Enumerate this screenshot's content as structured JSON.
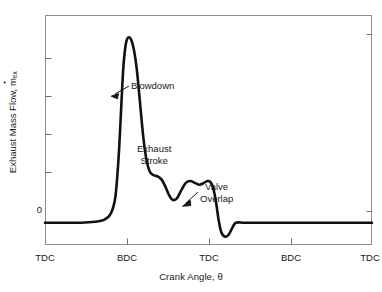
{
  "chart_data": {
    "type": "line",
    "title": "",
    "xlabel": "Crank Angle, θ",
    "ylabel_text": "Exhaust Mass Flow, ",
    "ylabel_symbol": "m",
    "ylabel_symbol_sub": "ex",
    "ylabel_full": "Exhaust Mass Flow, ṁex",
    "xtick_labels": [
      "TDC",
      "BDC",
      "TDC",
      "BDC",
      "TDC"
    ],
    "xtick_positions_px": [
      45,
      127,
      209,
      291,
      372
    ],
    "ytick_labels": [
      "0"
    ],
    "ytick_zero_px": 211,
    "ytick_minor_px": [
      58,
      96,
      134,
      172
    ],
    "grid": false,
    "legend": "none",
    "xlim": [
      0,
      720
    ],
    "ylim": [
      -0.12,
      1.12
    ],
    "series": [
      {
        "name": "Exhaust Mass Flow",
        "color": "#111111",
        "x": [
          0,
          40,
          80,
          110,
          130,
          145,
          155,
          162,
          168,
          172,
          176,
          180,
          185,
          190,
          196,
          202,
          208,
          214,
          220,
          226,
          232,
          240,
          248,
          256,
          264,
          272,
          280,
          290,
          300,
          310,
          320,
          330,
          340,
          350,
          358,
          364,
          370,
          376,
          382,
          388,
          396,
          404,
          412,
          420,
          440,
          480,
          520,
          560,
          600,
          640,
          680,
          720
        ],
        "y": [
          0.0,
          0.0,
          0.0,
          0.005,
          0.015,
          0.05,
          0.14,
          0.35,
          0.63,
          0.82,
          0.93,
          0.985,
          1.0,
          0.985,
          0.93,
          0.83,
          0.68,
          0.52,
          0.39,
          0.31,
          0.27,
          0.255,
          0.25,
          0.235,
          0.2,
          0.155,
          0.125,
          0.13,
          0.175,
          0.215,
          0.225,
          0.215,
          0.205,
          0.215,
          0.225,
          0.22,
          0.19,
          0.12,
          0.02,
          -0.05,
          -0.075,
          -0.065,
          -0.03,
          0.0,
          0.0,
          0.0,
          0.0,
          0.0,
          0.0,
          0.0,
          0.0,
          0.0
        ]
      }
    ],
    "annotations": [
      {
        "id": "blowdown",
        "text": "Blowdown",
        "lines": [
          "Blowdown"
        ],
        "label_px": [
          131,
          80
        ],
        "arrow_from_px": [
          128,
          87
        ],
        "arrow_to_px": [
          113,
          95
        ]
      },
      {
        "id": "exhaust-stroke",
        "text": "Exhaust Stroke",
        "lines": [
          "Exhaust",
          "Stroke"
        ],
        "label_px": [
          137,
          143
        ],
        "arrow_from_px": null,
        "arrow_to_px": null
      },
      {
        "id": "valve-overlap",
        "text": "Valve Overlap",
        "lines": [
          "Valve",
          "Overlap"
        ],
        "label_px": [
          200,
          181
        ],
        "arrow_from_px": [
          197,
          193
        ],
        "arrow_to_px": [
          184,
          205
        ]
      }
    ],
    "frame": {
      "left_px": 45,
      "top_px": 15,
      "right_px": 372,
      "bottom_px": 245
    },
    "colors": {
      "curve": "#111111",
      "frame": "#8d8d8d",
      "text": "#171717",
      "background": "#ffffff"
    }
  }
}
